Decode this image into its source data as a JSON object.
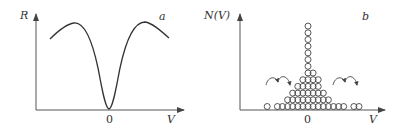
{
  "chart_data": [
    {
      "type": "line",
      "panel_label": "a",
      "title": "",
      "xlabel": "V",
      "ylabel": "R",
      "x_tick_labels": [
        "0"
      ],
      "grid": false,
      "legend": null,
      "description": "Resistance R vs voltage V: symmetric curve with sharp dip to zero at V=0, maxima on either side, slight decline toward edges",
      "x": [
        -1.0,
        -0.75,
        -0.5,
        -0.3,
        -0.15,
        0,
        0.15,
        0.3,
        0.5,
        0.75,
        1.0
      ],
      "values": [
        0.75,
        0.88,
        0.9,
        0.6,
        0.25,
        0.0,
        0.25,
        0.6,
        0.9,
        0.88,
        0.75
      ]
    },
    {
      "type": "bar",
      "panel_label": "b",
      "title": "",
      "xlabel": "V",
      "ylabel": "N(V)",
      "x_tick_labels": [
        "0"
      ],
      "grid": false,
      "legend": null,
      "description": "Distribution N(V) drawn as stacked circles; tall central column at V=0, pyramid around it, sparse tails; curved arrows indicate redistribution (hopping) on both sides",
      "categories": [
        -8,
        -6,
        -5,
        -4,
        -3,
        -2,
        -1,
        0,
        1,
        2,
        3,
        4,
        5,
        6,
        7,
        9,
        10
      ],
      "values": [
        1,
        1,
        1,
        2,
        3,
        4,
        5,
        13,
        6,
        5,
        3,
        2,
        1,
        1,
        1,
        1,
        1
      ],
      "annotations": [
        "curved arrows left of center",
        "curved arrows right of center"
      ]
    }
  ],
  "panel_a": {
    "ylabel": "R",
    "xlabel": "V",
    "origin_tick": "0",
    "tag": "a"
  },
  "panel_b": {
    "ylabel": "N(V)",
    "xlabel": "V",
    "origin_tick": "0",
    "tag": "b"
  }
}
